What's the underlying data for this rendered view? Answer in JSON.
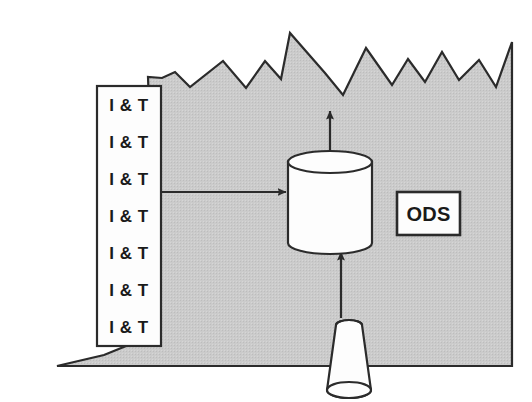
{
  "diagram": {
    "colors": {
      "legacy_fill": "#c9c9c9",
      "outline": "#2b2b2b",
      "shape_fill": "#fdfdfd",
      "background": "#ffffff",
      "text": "#1a1a1a"
    },
    "legacy_region": {
      "name": "legacy-environment",
      "fill": "#c9c9c9",
      "stroke": "#2b2b2b",
      "points": "57,366 512,366 512,42 496,87 479,60 459,80 442,52 425,82 408,59 392,85 366,48 343,95 325,73 290,33 281,79 265,61 246,88 223,61 190,87 175,72 162,78 148,77 149,105 123,100 133,125 115,140 130,162 112,176 125,196 111,218 134,232 112,254 132,276 114,296 133,312 110,330 131,344 104,355"
    },
    "it_box": {
      "name": "it-process-box",
      "x": 97,
      "y": 86,
      "width": 64,
      "height": 260,
      "fill": "#fdfdfd",
      "stroke": "#2b2b2b",
      "rows": [
        "I & T",
        "I & T",
        "I & T",
        "I & T",
        "I & T",
        "I & T",
        "I & T"
      ]
    },
    "cylinder": {
      "name": "ods-datastore-cylinder",
      "cx": 330,
      "top_y": 162,
      "bottom_y": 243,
      "rx": 42,
      "ry": 11,
      "fill": "#fdfdfd",
      "stroke": "#2b2b2b"
    },
    "ods_box": {
      "name": "ods-label-box",
      "x": 397,
      "y": 192,
      "width": 63,
      "height": 43,
      "label": "ODS",
      "fill": "#fdfdfd",
      "stroke": "#2b2b2b"
    },
    "cone": {
      "name": "data-feed-cone",
      "top_cx": 349,
      "top_y": 325,
      "top_rx": 13,
      "bottom_cx": 349,
      "bottom_y": 390,
      "bottom_rx": 22,
      "fill": "#fdfdfd",
      "stroke": "#2b2b2b"
    },
    "arrows": [
      {
        "name": "arrow-it-to-cylinder",
        "direction": "right",
        "x1": 161,
        "y1": 192,
        "x2": 286,
        "y2": 192
      },
      {
        "name": "arrow-cylinder-to-up",
        "direction": "up",
        "x1": 330,
        "y1": 160,
        "x2": 330,
        "y2": 111
      },
      {
        "name": "arrow-cone-to-cylinder",
        "direction": "up",
        "x1": 341,
        "y1": 318,
        "x2": 341,
        "y2": 252
      }
    ]
  }
}
